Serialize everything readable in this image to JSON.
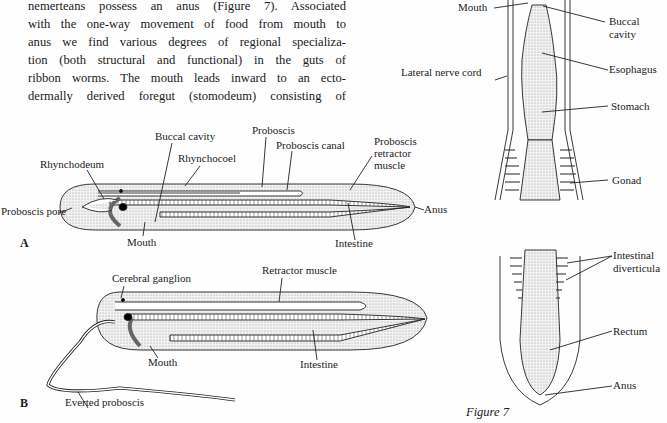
{
  "body_text": {
    "lines": [
      "nemerteans possess an anus (Figure 7). Associated",
      "with the one-way movement of food from mouth to",
      "anus we find various degrees of regional specializa-",
      "tion (both structural and functional) in the guts of",
      "ribbon worms. The mouth leads inward to an ecto-",
      "dermally derived foregut (stomodeum) consisting of"
    ]
  },
  "figure_a": {
    "panel_label": "A",
    "labels": {
      "buccal_cavity": "Buccal cavity",
      "proboscis": "Proboscis",
      "rhynchocoel": "Rhynchocoel",
      "proboscis_canal": "Proboscis canal",
      "proboscis_retractor_muscle": [
        "Proboscis",
        "retractor",
        "muscle"
      ],
      "rhynchodeum": "Rhynchodeum",
      "proboscis_pore": "Proboscis pore",
      "anus": "Anus",
      "mouth": "Mouth",
      "intestine": "Intestine"
    }
  },
  "figure_b": {
    "panel_label": "B",
    "labels": {
      "cerebral_ganglion": "Cerebral ganglion",
      "retractor_muscle": "Retractor muscle",
      "mouth": "Mouth",
      "intestine": "Intestine",
      "everted_proboscis": "Everted proboscis"
    }
  },
  "figure_right": {
    "labels": {
      "mouth": "Mouth",
      "buccal_cavity": [
        "Buccal",
        "cavity"
      ],
      "lateral_nerve_cord": "Lateral nerve cord",
      "esophagus": "Esophagus",
      "stomach": "Stomach",
      "gonad": "Gonad",
      "intestinal_diverticula": [
        "Intestinal",
        "diverticula"
      ],
      "rectum": "Rectum",
      "anus": "Anus"
    }
  },
  "figure_caption": "Figure 7",
  "colors": {
    "ink": "#1a1a1a",
    "stipple": "#dcdcdc",
    "paper": "#fefefe"
  }
}
